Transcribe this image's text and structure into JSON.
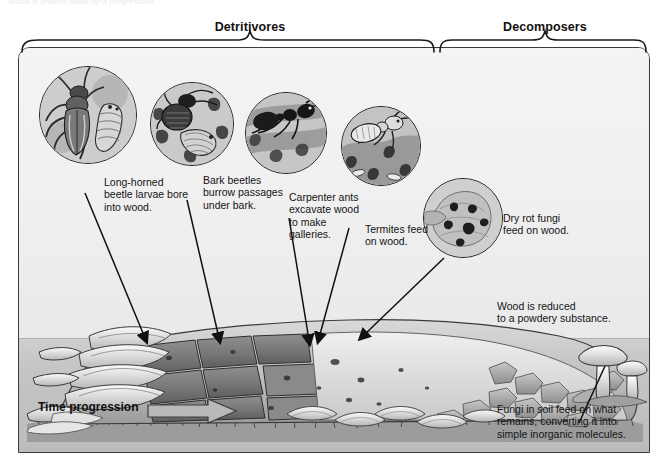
{
  "figure": {
    "top_caption": "Wood is broken down by a progression",
    "groups": [
      {
        "id": "detritivores",
        "label": "Detritivores"
      },
      {
        "id": "decomposers",
        "label": "Decomposers"
      }
    ],
    "callouts": [
      {
        "id": "long-horned-beetle",
        "icon": "beetle-larva-icon",
        "caption": "Long-horned\nbeetle larvae bore\ninto wood."
      },
      {
        "id": "bark-beetle",
        "icon": "bark-beetle-icon",
        "caption": "Bark beetles\nburrow passages\nunder bark."
      },
      {
        "id": "carpenter-ant",
        "icon": "carpenter-ant-icon",
        "caption": "Carpenter ants\nexcavate wood\nto make\ngalleries."
      },
      {
        "id": "termite",
        "icon": "termite-icon",
        "caption": "Termites feed\non wood."
      },
      {
        "id": "dry-rot-fungi",
        "icon": "dry-rot-fungi-icon",
        "caption": "Dry rot fungi\nfeed on wood."
      }
    ],
    "annotations": [
      {
        "id": "powdery-substance",
        "text": "Wood is reduced\nto a powdery substance."
      },
      {
        "id": "soil-fungi",
        "text": "Fungi in soil feed on what\nremains, converting it into\nsimple inorganic molecules."
      }
    ],
    "time_progression": {
      "label": "Time progression",
      "arrow": "right-arrow-icon"
    },
    "colors": {
      "ink": "#141414",
      "frame": "#3a3a3a",
      "sky": "#efefef",
      "ground": "#c4c4c4",
      "arrow_fill": "#b9b9b9"
    }
  }
}
